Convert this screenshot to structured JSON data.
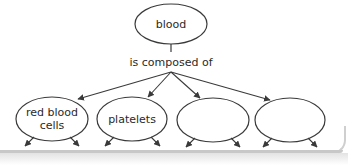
{
  "diagram": {
    "type": "concept-map",
    "root": {
      "label": "blood"
    },
    "link": {
      "label": "is composed of"
    },
    "children": [
      {
        "label_line1": "red blood",
        "label_line2": "cells",
        "filled": true
      },
      {
        "label_line1": "platelets",
        "label_line2": "",
        "filled": true
      },
      {
        "label_line1": "",
        "label_line2": "",
        "filled": false
      },
      {
        "label_line1": "",
        "label_line2": "",
        "filled": false
      }
    ],
    "colors": {
      "stroke": "#3a3a3a",
      "text": "#2a2a2a",
      "background": "#ffffff",
      "frame": "#c8c8c8"
    }
  }
}
